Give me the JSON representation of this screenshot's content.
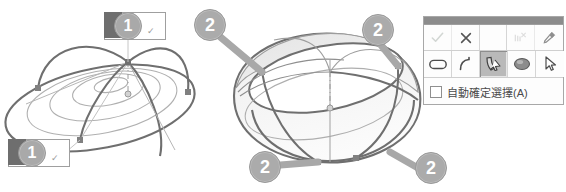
{
  "scene": {
    "title": "3D surface loft comparison",
    "left_shape": {
      "name": "flat-loft-surface",
      "description": "wireframe lofted dome with concentric elliptical sections"
    },
    "right_shape": {
      "name": "bulged-loft-surface",
      "description": "shaded tall dome surface with patch faces"
    }
  },
  "callouts": [
    {
      "id": "callout-1-top",
      "label": "1",
      "kind": "number-badge-1"
    },
    {
      "id": "callout-1-bottom",
      "label": "1",
      "kind": "number-badge-1"
    },
    {
      "id": "callout-2-topleft",
      "label": "2",
      "kind": "number-badge-2"
    },
    {
      "id": "callout-2-topright",
      "label": "2",
      "kind": "number-badge-2"
    },
    {
      "id": "callout-2-bottomleft",
      "label": "2",
      "kind": "number-badge-2"
    },
    {
      "id": "callout-2-bottomright",
      "label": "2",
      "kind": "number-badge-2"
    }
  ],
  "legend_check": "✓",
  "toolbar": {
    "name": "surface-edit-toolbar",
    "row1": [
      {
        "id": "accept",
        "icon": "check-icon",
        "state": "disabled"
      },
      {
        "id": "cancel",
        "icon": "close-icon",
        "state": "normal"
      },
      {
        "id": "undo",
        "icon": "undo-curve-icon",
        "state": "disabled"
      },
      {
        "id": "pin",
        "icon": "pin-icon",
        "state": "normal"
      }
    ],
    "row2": [
      {
        "id": "rounded-rect-tool",
        "icon": "rounded-rectangle-icon",
        "state": "normal"
      },
      {
        "id": "curve-tool",
        "icon": "curve-icon",
        "state": "normal"
      },
      {
        "id": "sweep-tool",
        "icon": "sweep-surface-icon",
        "state": "selected"
      },
      {
        "id": "blob-tool",
        "icon": "filled-ellipse-icon",
        "state": "normal"
      },
      {
        "id": "select-tool",
        "icon": "arrow-cursor-icon",
        "state": "normal"
      }
    ],
    "auto_confirm": {
      "label": "自動確定選擇(A)",
      "checked": false
    }
  },
  "colors": {
    "line_dark": "#6f6f6f",
    "line_light": "#b4b4b4",
    "badge_gray": "#a9a9a9",
    "surface_fill": "#f0f0f0",
    "toolbar_border": "#a8a8a8",
    "toolbar_grip": "#8c8c8c",
    "selected_btn": "#b9b9b9"
  }
}
